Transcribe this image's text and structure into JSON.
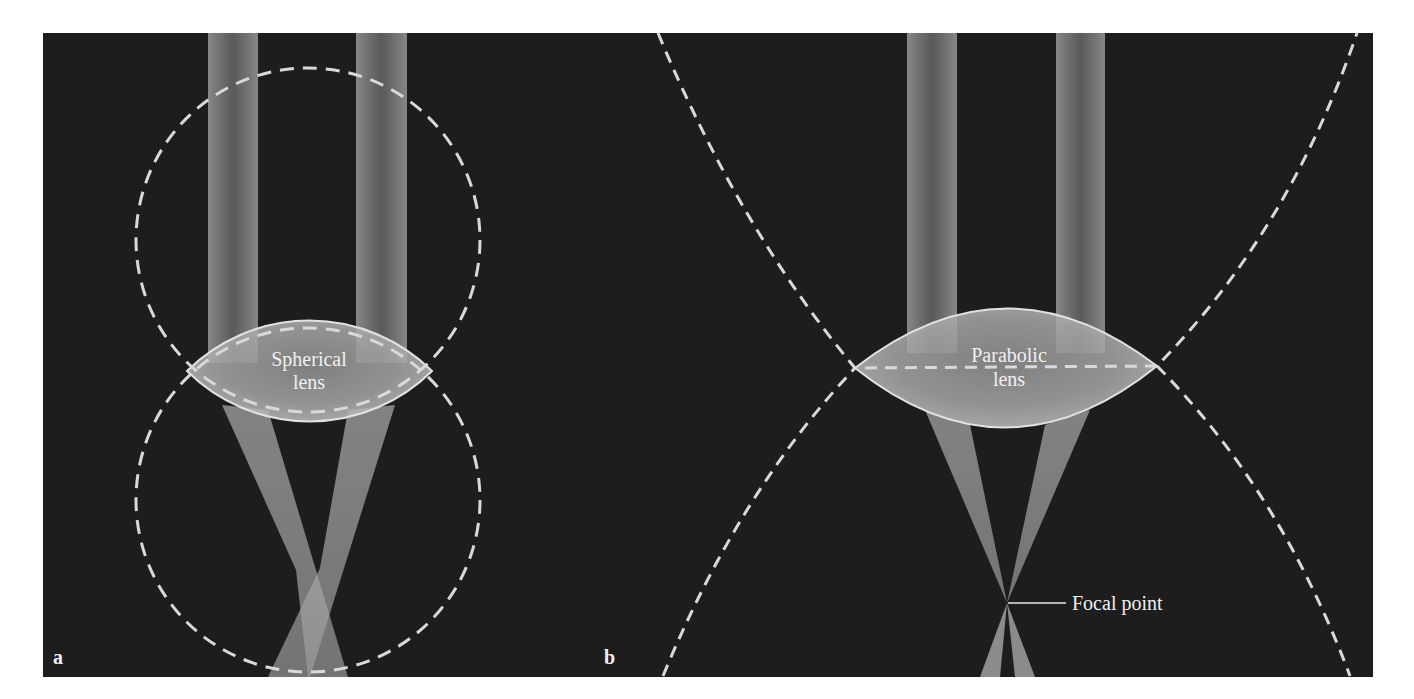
{
  "figure": {
    "background": "#ffffff",
    "panel_color": "#1d1d1d",
    "beam_color": "#bdbdbd",
    "dash_color": "#d9d9d9",
    "lens_color": "#c8c8c8"
  },
  "panel_a": {
    "label": "a",
    "lens_label_line1": "Spherical",
    "lens_label_line2": "lens"
  },
  "panel_b": {
    "label": "b",
    "lens_label_line1": "Parabolic",
    "lens_label_line2": "lens",
    "focal_label": "Focal point"
  }
}
